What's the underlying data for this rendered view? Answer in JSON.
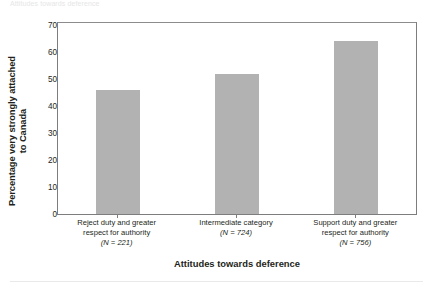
{
  "top_caption": "Attitudes towards deference",
  "chart_data": {
    "type": "bar",
    "title": "",
    "xlabel": "Attitudes towards deference",
    "ylabel_line1": "Percentage very strongly attached",
    "ylabel_line2": "to Canada",
    "ylim": [
      0,
      70
    ],
    "yticks": [
      0,
      10,
      20,
      30,
      40,
      50,
      60,
      70
    ],
    "ytick_labels": [
      "0",
      "10",
      "20",
      "30",
      "40",
      "50",
      "60",
      "70"
    ],
    "grid": false,
    "legend": "none",
    "bar_color": "#b2b2b2",
    "axis_color": "#7d7d7d",
    "categories": [
      "Reject duty and greater respect for authority",
      "Intermediate category",
      "Support duty and greater respect for authority"
    ],
    "category_lines": [
      [
        "Reject duty and greater",
        "respect for authority"
      ],
      [
        "Intermediate category"
      ],
      [
        "Support duty and greater",
        "respect for authority"
      ]
    ],
    "n_labels": [
      "(N = 221)",
      "(N = 724)",
      "(N = 756)"
    ],
    "n_values": [
      221,
      724,
      756
    ],
    "values": [
      46,
      52,
      64
    ]
  }
}
